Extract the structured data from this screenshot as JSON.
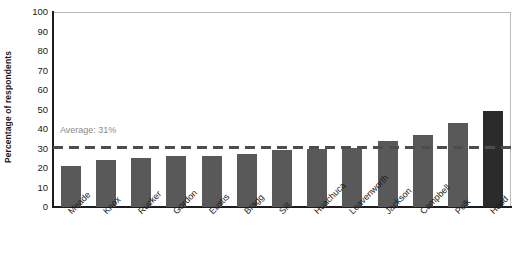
{
  "chart_data": {
    "type": "bar",
    "title": "",
    "xlabel": "",
    "ylabel": "Percentage of respondents",
    "ylim": [
      0,
      100
    ],
    "ytick_step": 10,
    "grid": true,
    "legend": null,
    "categories": [
      "Meade",
      "Knox",
      "Rucker",
      "Gordon",
      "Eustis",
      "Bragg",
      "Sill",
      "Huachuca",
      "Leavenworth",
      "Jackson",
      "Campbell",
      "Polk",
      "Hood"
    ],
    "values": [
      21,
      24,
      25,
      26,
      26,
      27,
      29,
      29.5,
      30.5,
      34,
      37,
      43,
      49
    ],
    "ytick_labels": [
      "100",
      "90",
      "80",
      "70",
      "60",
      "50",
      "40",
      "30",
      "20",
      "10",
      "0"
    ],
    "ytick_values": [
      100,
      90,
      80,
      70,
      60,
      50,
      40,
      30,
      20,
      10,
      0
    ],
    "annotations": [
      {
        "name": "average-line",
        "label": "Average: 31%",
        "value": 31,
        "style": "dashed-horizontal-line"
      }
    ],
    "bar_color": "#595959",
    "highlight_bar_color": "#2b2b2b",
    "highlight_category": "Hood",
    "gridline_color": "#c9c9c9",
    "axis_color": "#1c1c1c",
    "average_line_color": "#4d4d4d",
    "average_label_color": "#8a8a8a"
  }
}
